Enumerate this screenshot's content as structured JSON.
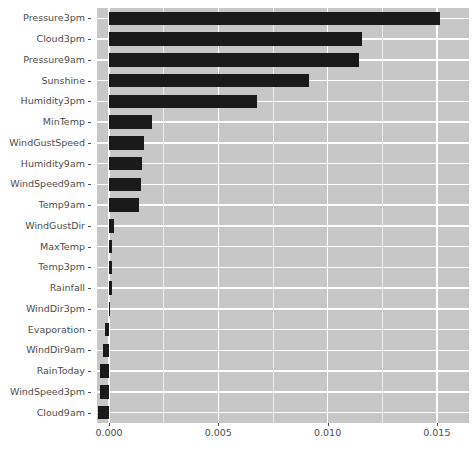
{
  "chart_data": {
    "type": "bar",
    "orientation": "horizontal",
    "title": "",
    "xlabel": "",
    "ylabel": "",
    "xlim": [
      -0.00055,
      0.01647
    ],
    "xticks": [
      "0.000",
      "0.005",
      "0.010",
      "0.015"
    ],
    "xtick_values": [
      0.0,
      0.005,
      0.01,
      0.015
    ],
    "grid": true,
    "legend": false,
    "background": "#c7c7c7",
    "gridline_color": "#ffffff",
    "bar_color": "#1a1a1a",
    "text_color": "#4d4d4d",
    "categories": [
      "Pressure3pm",
      "Cloud3pm",
      "Pressure9am",
      "Sunshine",
      "Humidity3pm",
      "MinTemp",
      "WindGustSpeed",
      "Humidity9am",
      "WindSpeed9am",
      "Temp9am",
      "WindGustDir",
      "MaxTemp",
      "Temp3pm",
      "Rainfall",
      "WindDir3pm",
      "Evaporation",
      "WindDir9am",
      "RainToday",
      "WindSpeed3pm",
      "Cloud9am"
    ],
    "values": [
      0.01514,
      0.01157,
      0.01143,
      0.00914,
      0.00676,
      0.00195,
      0.00162,
      0.00152,
      0.00148,
      0.00138,
      0.00024,
      0.00014,
      0.00014,
      0.00014,
      0.0,
      -0.00019,
      -0.00029,
      -0.00043,
      -0.00043,
      -0.00052
    ]
  }
}
